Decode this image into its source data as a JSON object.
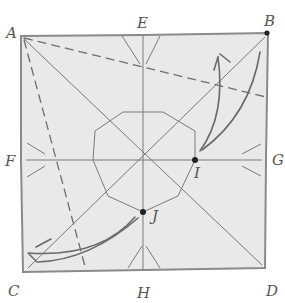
{
  "diagram": {
    "type": "origami-crease-pattern",
    "labels": {
      "A": "A",
      "B": "B",
      "C": "C",
      "D": "D",
      "E": "E",
      "F": "F",
      "G": "G",
      "H": "H",
      "I": "I",
      "J": "J"
    },
    "marked_points": [
      "B",
      "I",
      "J"
    ],
    "fold_lines": {
      "valley_folds": [
        "A to right edge below B",
        "A to bottom edge right of C"
      ],
      "arrows": [
        "fold toward B from I",
        "fold toward C from J"
      ]
    },
    "colors": {
      "paper": "#e9e9e9",
      "edge": "#8a8a8a",
      "crease": "#7a7a7a",
      "dot": "#222222"
    }
  }
}
